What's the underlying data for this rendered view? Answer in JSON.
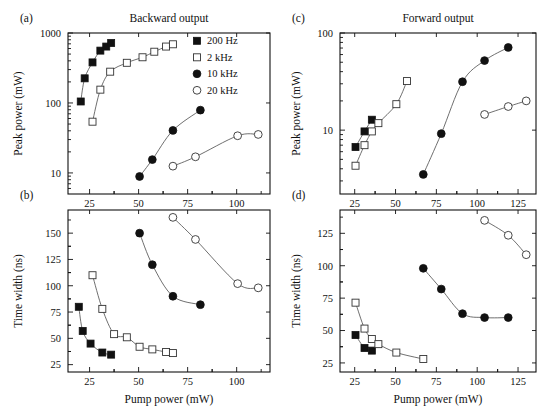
{
  "figure": {
    "width": 547,
    "height": 417,
    "columns": [
      {
        "id": "backward",
        "title": "Backward output"
      },
      {
        "id": "forward",
        "title": "Forward output"
      }
    ],
    "panel_tags": {
      "a": "(a)",
      "b": "(b)",
      "c": "(c)",
      "d": "(d)"
    },
    "legend": {
      "entries": [
        {
          "label": "200 Hz",
          "marker": "filled-square",
          "color": "#111111"
        },
        {
          "label": "2 kHz",
          "marker": "open-square",
          "color": "#111111"
        },
        {
          "label": "10 kHz",
          "marker": "filled-circle",
          "color": "#111111"
        },
        {
          "label": "20 kHz",
          "marker": "open-circle",
          "color": "#111111"
        }
      ]
    }
  },
  "chart_data": [
    {
      "id": "panel-a",
      "type": "scatter",
      "panel": "(a)",
      "title": "Backward output",
      "xlabel": "",
      "ylabel": "Peak power (mW)",
      "xscale": "linear",
      "yscale": "log",
      "xlim": [
        14,
        117
      ],
      "ylim": [
        5,
        1000
      ],
      "xticks": [
        25,
        50,
        75,
        100
      ],
      "yticks": [
        10,
        100,
        1000
      ],
      "grid": false,
      "legend_position": "top-right",
      "series": [
        {
          "name": "200 Hz",
          "marker": "filled-square",
          "x": [
            20.5,
            22.5,
            26.5,
            30.5,
            33.5,
            36.0
          ],
          "y": [
            105,
            225,
            380,
            560,
            640,
            720
          ]
        },
        {
          "name": "2 kHz",
          "marker": "open-square",
          "x": [
            26.5,
            30.5,
            35.5,
            44.0,
            52.0,
            58.0,
            64.0,
            67.5
          ],
          "y": [
            54,
            155,
            280,
            375,
            450,
            540,
            640,
            690
          ]
        },
        {
          "name": "10 kHz",
          "marker": "filled-circle",
          "x": [
            50.5,
            57.0,
            67.5,
            81.5
          ],
          "y": [
            8.9,
            15.5,
            40.5,
            79.0
          ]
        },
        {
          "name": "20 kHz",
          "marker": "open-circle",
          "x": [
            67.5,
            79.0,
            100.5,
            111.0
          ],
          "y": [
            12.5,
            17.0,
            34.0,
            35.5
          ]
        }
      ]
    },
    {
      "id": "panel-b",
      "type": "scatter",
      "panel": "(b)",
      "title": "",
      "xlabel": "Pump power (mW)",
      "ylabel": "Time width (ns)",
      "xscale": "linear",
      "yscale": "linear",
      "xlim": [
        14,
        117
      ],
      "ylim": [
        18,
        172
      ],
      "xticks": [
        25,
        50,
        75,
        100
      ],
      "yticks": [
        25,
        50,
        75,
        100,
        125,
        150
      ],
      "grid": false,
      "series": [
        {
          "name": "200 Hz",
          "marker": "filled-square",
          "x": [
            19.5,
            21.5,
            25.5,
            31.5,
            36.0
          ],
          "y": [
            80,
            57,
            45,
            36.5,
            34.5
          ]
        },
        {
          "name": "2 kHz",
          "marker": "open-square",
          "x": [
            26.5,
            31.5,
            37.5,
            44.0,
            50.5,
            57.0,
            64.0,
            67.5
          ],
          "y": [
            110,
            78,
            54,
            51,
            42,
            39.5,
            37,
            36
          ]
        },
        {
          "name": "10 kHz",
          "marker": "filled-circle",
          "x": [
            50.5,
            57.0,
            67.5,
            81.5
          ],
          "y": [
            150,
            120,
            90,
            82
          ]
        },
        {
          "name": "20 kHz",
          "marker": "open-circle",
          "x": [
            67.5,
            79.0,
            100.5,
            111.0
          ],
          "y": [
            165,
            144,
            102,
            98
          ]
        }
      ]
    },
    {
      "id": "panel-c",
      "type": "scatter",
      "panel": "(c)",
      "title": "Forward output",
      "xlabel": "",
      "ylabel": "Peak power (mW)",
      "xscale": "linear",
      "yscale": "log",
      "xlim": [
        16,
        136
      ],
      "ylim": [
        2.2,
        100
      ],
      "xticks": [
        25,
        50,
        75,
        100,
        125
      ],
      "yticks": [
        10,
        100
      ],
      "grid": false,
      "series": [
        {
          "name": "200 Hz",
          "marker": "filled-square",
          "x": [
            25.5,
            31.0,
            35.5
          ],
          "y": [
            6.7,
            9.7,
            12.8
          ]
        },
        {
          "name": "2 kHz",
          "marker": "open-square",
          "x": [
            25.5,
            31.0,
            35.5,
            39.5,
            50.5,
            57.0
          ],
          "y": [
            4.3,
            7.0,
            9.7,
            11.8,
            18.5,
            32.0
          ]
        },
        {
          "name": "10 kHz",
          "marker": "filled-circle",
          "x": [
            67.0,
            78.0,
            91.0,
            104.5,
            119.0
          ],
          "y": [
            3.5,
            9.2,
            31.5,
            52.0,
            71.0
          ]
        },
        {
          "name": "20 kHz",
          "marker": "open-circle",
          "x": [
            104.5,
            119.0,
            130.0
          ],
          "y": [
            14.5,
            17.5,
            20.0
          ]
        }
      ]
    },
    {
      "id": "panel-d",
      "type": "scatter",
      "panel": "(d)",
      "title": "",
      "xlabel": "Pump power (mW)",
      "ylabel": "Time width (ns)",
      "xscale": "linear",
      "yscale": "linear",
      "xlim": [
        16,
        136
      ],
      "ylim": [
        18,
        143
      ],
      "xticks": [
        25,
        50,
        75,
        100,
        125
      ],
      "yticks": [
        25,
        50,
        75,
        100,
        125
      ],
      "grid": false,
      "series": [
        {
          "name": "200 Hz",
          "marker": "filled-square",
          "x": [
            25.5,
            31.0,
            35.5
          ],
          "y": [
            46.5,
            36.5,
            34.5
          ]
        },
        {
          "name": "2 kHz",
          "marker": "open-square",
          "x": [
            25.5,
            31.0,
            35.5,
            39.5,
            50.5,
            67.0
          ],
          "y": [
            71.5,
            51.5,
            43.5,
            39.5,
            33.0,
            28.0
          ]
        },
        {
          "name": "10 kHz",
          "marker": "filled-circle",
          "x": [
            67.0,
            78.0,
            91.0,
            104.5,
            119.0
          ],
          "y": [
            98.0,
            82.0,
            63.0,
            60.0,
            60.0
          ]
        },
        {
          "name": "20 kHz",
          "marker": "open-circle",
          "x": [
            104.5,
            119.0,
            130.0
          ],
          "y": [
            135.0,
            123.5,
            108.5
          ]
        }
      ]
    }
  ]
}
